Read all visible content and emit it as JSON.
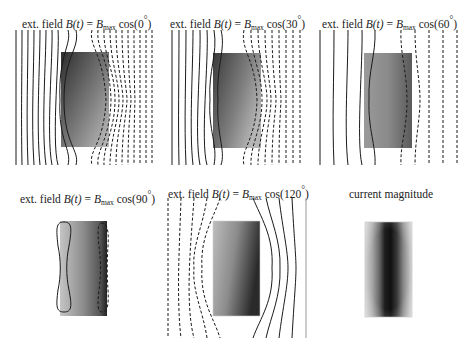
{
  "figure": {
    "panels": [
      {
        "id": "p0",
        "title_prefix": "ext. field ",
        "title_fn": "B(t)",
        "title_eq": " = ",
        "title_B": "B",
        "title_sub": "max",
        "title_cos": " cos(",
        "title_angle": "0",
        "title_deg": "°",
        "title_close": ")",
        "angle_deg": 0,
        "field_lines_solid": 9,
        "field_lines_dashed": 9
      },
      {
        "id": "p1",
        "title_prefix": "ext. field ",
        "title_fn": "B(t)",
        "title_eq": " = ",
        "title_B": "B",
        "title_sub": "max",
        "title_cos": " cos(",
        "title_angle": "30",
        "title_deg": "°",
        "title_close": ")",
        "angle_deg": 30,
        "field_lines_solid": 7,
        "field_lines_dashed": 8
      },
      {
        "id": "p2",
        "title_prefix": "ext. field ",
        "title_fn": "B(t)",
        "title_eq": " = ",
        "title_B": "B",
        "title_sub": "max",
        "title_cos": " cos(",
        "title_angle": "60",
        "title_deg": "°",
        "title_close": ")",
        "angle_deg": 60,
        "field_lines_solid": 4,
        "field_lines_dashed": 5
      },
      {
        "id": "p3",
        "title_prefix": "ext. field ",
        "title_fn": "B(t)",
        "title_eq": " = ",
        "title_B": "B",
        "title_sub": "max",
        "title_cos": " cos(",
        "title_angle": "90",
        "title_deg": "°",
        "title_close": ")",
        "angle_deg": 90,
        "field_lines_solid": 1,
        "field_lines_dashed": 1
      },
      {
        "id": "p4",
        "title_prefix": "ext. field ",
        "title_fn": "B(t)",
        "title_eq": " = ",
        "title_B": "B",
        "title_sub": "max",
        "title_cos": " cos(",
        "title_angle": "120",
        "title_deg": "°",
        "title_close": ")",
        "angle_deg": 120,
        "field_lines_solid": 5,
        "field_lines_dashed": 5
      },
      {
        "id": "p5",
        "title_text": "current magnitude"
      }
    ],
    "legend": {
      "solid_line": "positive field line",
      "dashed_line": "negative field line"
    },
    "colors": {
      "line": "#1a1a1a",
      "background": "#ffffff",
      "plate_dark": "#2a2a2a",
      "plate_light": "#c8c8c8"
    }
  }
}
